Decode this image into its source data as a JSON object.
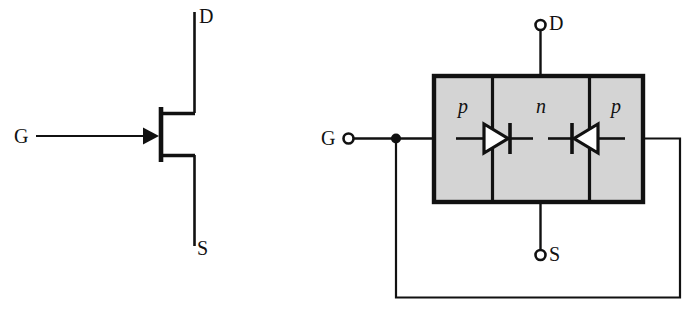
{
  "figure": {
    "type": "circuit-diagram",
    "background_color": "#ffffff",
    "line_color": "#111111",
    "region_fill_color": "#d4d4d4"
  },
  "symbol_diagram": {
    "name": "jfet-schematic-symbol",
    "terminals": {
      "drain_label": "D",
      "source_label": "S",
      "gate_label": "G"
    },
    "gate_arrow_direction": "right"
  },
  "structure_diagram": {
    "name": "jfet-pnp-structure",
    "terminals": {
      "drain_label": "D",
      "source_label": "S",
      "gate_label": "G"
    },
    "regions": [
      {
        "label": "p",
        "position": "left"
      },
      {
        "label": "n",
        "position": "center"
      },
      {
        "label": "p",
        "position": "right"
      }
    ],
    "diodes": [
      {
        "name": "left-junction-diode",
        "direction": "right"
      },
      {
        "name": "right-junction-diode",
        "direction": "left"
      }
    ],
    "gate_node": "filled-junction-dot",
    "feedback_wire": "gate-to-right-p-region"
  }
}
